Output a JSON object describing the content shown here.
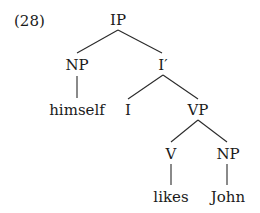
{
  "example_number": "(28)",
  "tree": {
    "root": {
      "label": "IP"
    },
    "np_subject": {
      "label": "NP"
    },
    "i_bar": {
      "label": "I′"
    },
    "subject_word": {
      "label": "himself"
    },
    "infl": {
      "label": "I"
    },
    "vp": {
      "label": "VP"
    },
    "verb": {
      "label": "V"
    },
    "np_object": {
      "label": "NP"
    },
    "verb_word": {
      "label": "likes"
    },
    "object_word": {
      "label": "John"
    }
  },
  "edges": [
    [
      "IP",
      "NP"
    ],
    [
      "IP",
      "I′"
    ],
    [
      "NP",
      "himself"
    ],
    [
      "I′",
      "I"
    ],
    [
      "I′",
      "VP"
    ],
    [
      "VP",
      "V"
    ],
    [
      "VP",
      "NP"
    ],
    [
      "V",
      "likes"
    ],
    [
      "NP",
      "John"
    ]
  ],
  "colors": {
    "text": "#1a1a1a",
    "line": "#2a2a2a",
    "background": "#ffffff"
  }
}
